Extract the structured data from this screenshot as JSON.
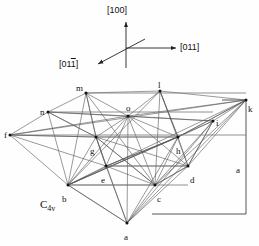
{
  "figure": {
    "symmetry_label": "C",
    "symmetry_sub": "4v",
    "caption_note": "cubic lattice projection with point-group label"
  },
  "axes": {
    "up_label": "[100]",
    "right_label": "[011]",
    "left_label_prefix": "[01",
    "left_label_bar": "1",
    "left_label_suffix": "]",
    "origin": {
      "x": 126,
      "y": 48
    }
  },
  "dimension": {
    "vertical_label": "a"
  },
  "chart_data": {
    "type": "diagram-vertices",
    "vertices": [
      {
        "id": "a",
        "x": 127,
        "y": 223,
        "lx": 124,
        "ly": 233
      },
      {
        "id": "b",
        "x": 68,
        "y": 185,
        "lx": 62,
        "ly": 195
      },
      {
        "id": "c",
        "x": 155,
        "y": 185,
        "lx": 157,
        "ly": 195
      },
      {
        "id": "d",
        "x": 188,
        "y": 166,
        "lx": 190,
        "ly": 176
      },
      {
        "id": "e",
        "x": 106,
        "y": 166,
        "lx": 101,
        "ly": 176
      },
      {
        "id": "f",
        "x": 10,
        "y": 135,
        "lx": 4,
        "ly": 131
      },
      {
        "id": "g",
        "x": 96,
        "y": 137,
        "lx": 90,
        "ly": 147
      },
      {
        "id": "h",
        "x": 178,
        "y": 137,
        "lx": 176,
        "ly": 147
      },
      {
        "id": "i",
        "x": 213,
        "y": 121,
        "lx": 216,
        "ly": 119
      },
      {
        "id": "k",
        "x": 246,
        "y": 100,
        "lx": 248,
        "ly": 105
      },
      {
        "id": "l",
        "x": 160,
        "y": 91,
        "lx": 158,
        "ly": 81
      },
      {
        "id": "m",
        "x": 86,
        "y": 93,
        "lx": 76,
        "ly": 84
      },
      {
        "id": "n",
        "x": 48,
        "y": 112,
        "lx": 40,
        "ly": 108
      },
      {
        "id": "o",
        "x": 128,
        "y": 116,
        "lx": 126,
        "ly": 104
      }
    ],
    "edges": [
      [
        "f",
        "n"
      ],
      [
        "n",
        "m"
      ],
      [
        "m",
        "l"
      ],
      [
        "l",
        "k"
      ],
      [
        "k",
        "i"
      ],
      [
        "i",
        "d"
      ],
      [
        "f",
        "b"
      ],
      [
        "b",
        "a"
      ],
      [
        "a",
        "c"
      ],
      [
        "c",
        "d"
      ],
      [
        "a",
        "d"
      ],
      [
        "f",
        "o"
      ],
      [
        "n",
        "o"
      ],
      [
        "m",
        "o"
      ],
      [
        "l",
        "o"
      ],
      [
        "k",
        "o"
      ],
      [
        "i",
        "o"
      ],
      [
        "o",
        "b"
      ],
      [
        "o",
        "c"
      ],
      [
        "o",
        "d"
      ],
      [
        "o",
        "e"
      ],
      [
        "o",
        "g"
      ],
      [
        "o",
        "h"
      ],
      [
        "o",
        "a"
      ],
      [
        "g",
        "b"
      ],
      [
        "g",
        "e"
      ],
      [
        "g",
        "n"
      ],
      [
        "g",
        "m"
      ],
      [
        "g",
        "f"
      ],
      [
        "h",
        "d"
      ],
      [
        "h",
        "c"
      ],
      [
        "h",
        "i"
      ],
      [
        "h",
        "l"
      ],
      [
        "h",
        "k"
      ],
      [
        "b",
        "e"
      ],
      [
        "e",
        "c"
      ],
      [
        "c",
        "d"
      ],
      [
        "e",
        "d"
      ],
      [
        "b",
        "c"
      ],
      [
        "g",
        "h"
      ],
      [
        "n",
        "i"
      ],
      [
        "f",
        "k"
      ],
      [
        "b",
        "m"
      ],
      [
        "b",
        "n"
      ],
      [
        "b",
        "l"
      ],
      [
        "b",
        "k"
      ],
      [
        "b",
        "i"
      ],
      [
        "b",
        "h"
      ],
      [
        "c",
        "k"
      ],
      [
        "c",
        "i"
      ],
      [
        "c",
        "l"
      ],
      [
        "c",
        "m"
      ],
      [
        "c",
        "g"
      ],
      [
        "a",
        "b"
      ],
      [
        "a",
        "e"
      ],
      [
        "a",
        "g"
      ],
      [
        "a",
        "h"
      ],
      [
        "a",
        "i"
      ],
      [
        "a",
        "k"
      ],
      [
        "d",
        "k"
      ],
      [
        "d",
        "i"
      ],
      [
        "d",
        "l"
      ],
      [
        "e",
        "g"
      ],
      [
        "e",
        "h"
      ],
      [
        "f",
        "g"
      ],
      [
        "f",
        "e"
      ],
      [
        "n",
        "g"
      ],
      [
        "m",
        "g"
      ],
      [
        "l",
        "h"
      ],
      [
        "k",
        "h"
      ],
      [
        "g",
        "c"
      ],
      [
        "h",
        "b"
      ],
      [
        "g",
        "d"
      ],
      [
        "h",
        "e"
      ]
    ],
    "grid_lines": [
      [
        10,
        135,
        246,
        135
      ],
      [
        48,
        112,
        213,
        112
      ],
      [
        68,
        185,
        188,
        185
      ],
      [
        86,
        93,
        246,
        93
      ],
      [
        96,
        137,
        178,
        137
      ],
      [
        106,
        166,
        188,
        166
      ]
    ],
    "arrow_targets": [
      "f",
      "n",
      "b",
      "c",
      "d",
      "i",
      "k",
      "a",
      "o",
      "e",
      "g",
      "h",
      "m",
      "l"
    ]
  }
}
